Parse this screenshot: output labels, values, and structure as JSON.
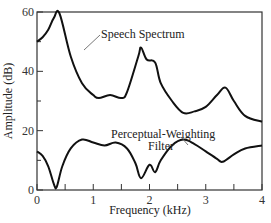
{
  "chart_data": {
    "type": "line",
    "title": "",
    "xlabel": "Frequency (kHz)",
    "ylabel": "Amplitude (dB)",
    "xlim": [
      0,
      4
    ],
    "ylim": [
      0,
      60
    ],
    "x_ticks": [
      "0",
      "1",
      "2",
      "3",
      "4"
    ],
    "y_ticks": [
      "0",
      "20",
      "40",
      "60"
    ],
    "grid": false,
    "series": [
      {
        "name": "Speech Spectrum",
        "x": [
          0,
          0.1,
          0.2,
          0.3,
          0.4,
          0.6,
          0.8,
          1.0,
          1.1,
          1.3,
          1.5,
          1.6,
          1.8,
          1.85,
          1.95,
          2.1,
          2.2,
          2.4,
          2.6,
          2.8,
          3.0,
          3.2,
          3.35,
          3.5,
          3.7,
          4.0
        ],
        "values": [
          50,
          51.5,
          54,
          58,
          59.5,
          45,
          36,
          32,
          31,
          32,
          31,
          33,
          45,
          48,
          44,
          43,
          36,
          30,
          26,
          26.5,
          28,
          32,
          34.5,
          30,
          25,
          23
        ]
      },
      {
        "name": "Perceptual-Weighting Filter",
        "x": [
          0,
          0.1,
          0.2,
          0.3,
          0.35,
          0.45,
          0.6,
          0.8,
          1.0,
          1.2,
          1.4,
          1.6,
          1.75,
          1.85,
          2.0,
          2.1,
          2.2,
          2.4,
          2.6,
          2.8,
          3.0,
          3.2,
          3.3,
          3.5,
          3.7,
          4.0
        ],
        "values": [
          13,
          11.5,
          8,
          2,
          1,
          8,
          14,
          17,
          16,
          15,
          16,
          14,
          9,
          4,
          8.5,
          6,
          10,
          15,
          17,
          15.5,
          13,
          10.5,
          9.5,
          12,
          14,
          15
        ]
      }
    ],
    "annotations": [
      {
        "text": "Speech Spectrum",
        "x": 0.95,
        "y": 53
      },
      {
        "text": "Perceptual-Weighting",
        "x": 2.2,
        "y": 21
      },
      {
        "text": "Filter",
        "x": 2.7,
        "y": 16
      }
    ]
  }
}
